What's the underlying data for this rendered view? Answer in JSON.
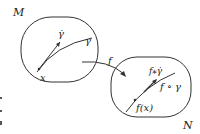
{
  "diagram": {
    "type": "manifold-map",
    "domain": {
      "label": "M",
      "point_label": "x",
      "curve_label": "γ",
      "tangent_label": "γ̇"
    },
    "codomain": {
      "label": "N",
      "point_label": "f(x)",
      "curve_label": "f ∘ γ",
      "tangent_label": "f⁎γ̇"
    },
    "map": {
      "label": "f"
    },
    "colors": {
      "stroke": "#333333",
      "text": "#222222",
      "background": "#ffffff"
    }
  }
}
